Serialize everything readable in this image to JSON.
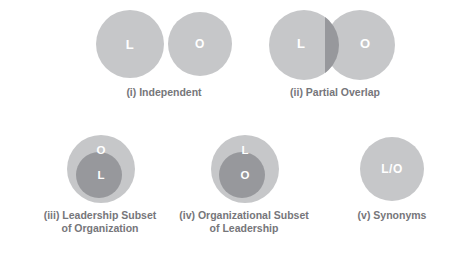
{
  "figure": {
    "colors": {
      "circle_light": "#c6c7c9",
      "circle_dark": "#97989c",
      "label_text": "#ffffff",
      "caption_text": "#76767a",
      "background": "#ffffff"
    }
  },
  "panels": [
    {
      "id": "independent",
      "caption": "(i) Independent",
      "circles": [
        {
          "label": "L",
          "role": "leadership",
          "shade": "light"
        },
        {
          "label": "O",
          "role": "organization",
          "shade": "light"
        }
      ]
    },
    {
      "id": "partial_overlap",
      "caption": "(ii) Partial Overlap",
      "circles": [
        {
          "label": "L",
          "role": "leadership",
          "shade": "light"
        },
        {
          "label": "O",
          "role": "organization",
          "shade": "light"
        }
      ],
      "intersection_shade": "dark"
    },
    {
      "id": "leadership_subset",
      "caption": "(iii) Leadership Subset\nof Organization",
      "circles": [
        {
          "label": "O",
          "role": "organization",
          "shade": "light",
          "position": "outer"
        },
        {
          "label": "L",
          "role": "leadership",
          "shade": "dark",
          "position": "inner"
        }
      ]
    },
    {
      "id": "organizational_subset",
      "caption": "(iv) Organizational Subset\nof Leadership",
      "circles": [
        {
          "label": "L",
          "role": "leadership",
          "shade": "light",
          "position": "outer"
        },
        {
          "label": "O",
          "role": "organization",
          "shade": "dark",
          "position": "inner"
        }
      ]
    },
    {
      "id": "synonyms",
      "caption": "(v) Synonyms",
      "circles": [
        {
          "label": "L/O",
          "role": "leadership-organization",
          "shade": "light"
        }
      ]
    }
  ]
}
